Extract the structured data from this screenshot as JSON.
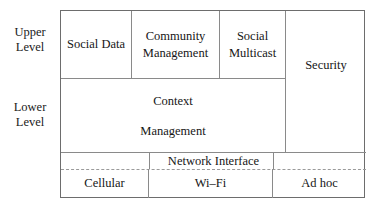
{
  "diagram": {
    "type": "layered-architecture-block-diagram",
    "levels": [
      {
        "id": "upper",
        "line1": "Upper",
        "line2": "Level"
      },
      {
        "id": "lower",
        "line1": "Lower",
        "line2": "Level"
      }
    ],
    "upper_row": [
      {
        "id": "social-data",
        "line1": "Social Data",
        "line2": ""
      },
      {
        "id": "community-management",
        "line1": "Community",
        "line2": "Management"
      },
      {
        "id": "social-multicast",
        "line1": "Social",
        "line2": "Multicast"
      }
    ],
    "lower_row": [
      {
        "id": "context-management",
        "line1": "Context",
        "line2": "Management"
      }
    ],
    "side_column": {
      "id": "security",
      "label": "Security"
    },
    "network_strip": {
      "id": "network-interface",
      "label": "Network Interface"
    },
    "access_row": [
      {
        "id": "cellular",
        "label": "Cellular"
      },
      {
        "id": "wifi",
        "label": "Wi–Fi"
      },
      {
        "id": "adhoc",
        "label": "Ad hoc"
      }
    ],
    "colors": {
      "frame_stroke": "#6d6d6d",
      "inner_stroke": "#8a8a8a",
      "dashed_stroke": "#9a9a9a",
      "text": "#161616",
      "background": "#ffffff"
    }
  }
}
